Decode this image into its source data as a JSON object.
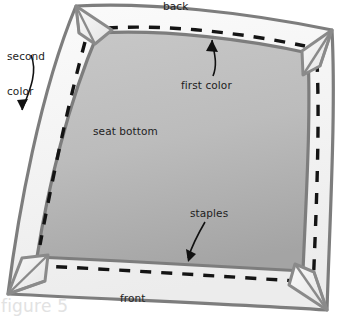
{
  "figure": {
    "caption": "figure 5",
    "caption_color": "#e2e2e2",
    "background_color": "#ffffff"
  },
  "diagram": {
    "colors": {
      "seat_bottom_fill_light": "#c3c3c3",
      "seat_bottom_fill_dark": "#a8a8a8",
      "border_fabric_fill": "#f4f4f4",
      "outline_stroke": "#7d7d7d",
      "fold_stroke": "#8a8a8a",
      "staple_stroke": "#111111",
      "label_text": "#1d1d1d"
    },
    "labels": [
      {
        "id": "second-color",
        "text": "second\ncolor",
        "line1": "second",
        "line2": "color"
      },
      {
        "id": "back",
        "text": "back"
      },
      {
        "id": "first-color",
        "text": "first color"
      },
      {
        "id": "seat-bottom",
        "text": "seat bottom"
      },
      {
        "id": "staples",
        "text": "staples"
      },
      {
        "id": "front",
        "text": "front"
      }
    ],
    "label_text": {
      "second_color_line1": "second",
      "second_color_line2": "color",
      "back": "back",
      "first_color": "first color",
      "seat_bottom": "seat bottom",
      "staples": "staples",
      "front": "front"
    },
    "callouts": [
      {
        "id": "second-color-arrow",
        "points_to": "outer fabric border left edge"
      },
      {
        "id": "first-color-arrow",
        "points_to": "inner seat bottom panel at back edge"
      },
      {
        "id": "staples-arrow",
        "points_to": "dashed staple line at front edge"
      }
    ],
    "parts": {
      "corner_folds": 4,
      "staple_lines": 4,
      "edges": [
        "back",
        "right",
        "front",
        "left"
      ]
    }
  }
}
